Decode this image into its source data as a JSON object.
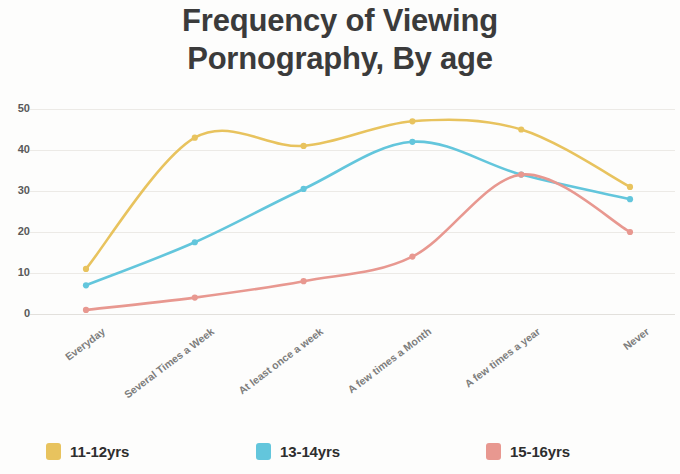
{
  "title": {
    "line1": "Frequency of Viewing",
    "line2": "Pornography, By age"
  },
  "legend": [
    {
      "label": "11-12yrs",
      "color": "#E8C35E"
    },
    {
      "label": "13-14yrs",
      "color": "#63C6DC"
    },
    {
      "label": "15-16yrs",
      "color": "#E89890"
    }
  ],
  "chart_data": {
    "type": "line",
    "title": "Frequency of Viewing Pornography, By age",
    "xlabel": "",
    "ylabel": "",
    "ylim": [
      0,
      52
    ],
    "yticks": [
      0,
      10,
      20,
      30,
      40,
      50
    ],
    "grid": true,
    "legend_position": "bottom",
    "categories": [
      "Everyday",
      "Several Times a Week",
      "At least once a week",
      "A few times a Month",
      "A few times a year",
      "Never"
    ],
    "series": [
      {
        "name": "11-12yrs",
        "color": "#E8C35E",
        "values": [
          11,
          43,
          41,
          47,
          45,
          31
        ]
      },
      {
        "name": "13-14yrs",
        "color": "#63C6DC",
        "values": [
          7,
          17.5,
          30.5,
          42,
          34,
          28
        ]
      },
      {
        "name": "15-16yrs",
        "color": "#E89890",
        "values": [
          1,
          4,
          8,
          14,
          34,
          20
        ]
      }
    ]
  }
}
